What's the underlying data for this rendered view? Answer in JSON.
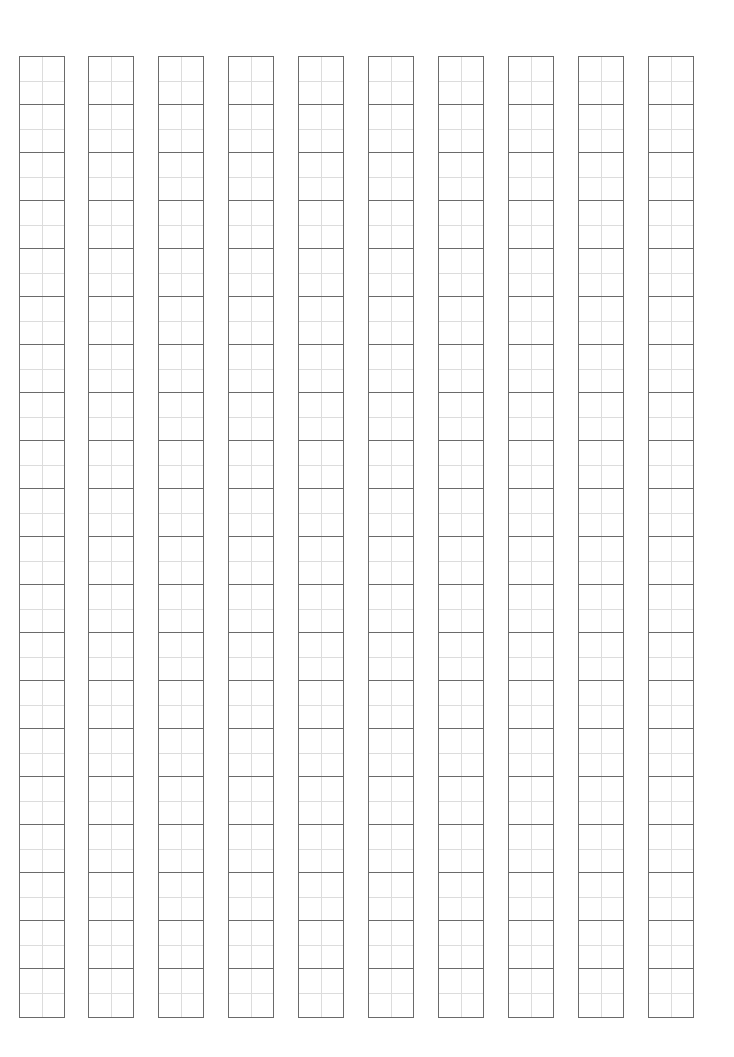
{
  "sheet": {
    "type": "tianzige-practice-grid",
    "columns": 10,
    "rows_per_column": 20,
    "column_left_positions_px": [
      19,
      88,
      158,
      228,
      298,
      368,
      438,
      508,
      578,
      648
    ],
    "column_width_px": 46,
    "grid_top_px": 56,
    "cell_height_px": 48,
    "colors": {
      "background": "#ffffff",
      "cell_border": "#6a6a6a",
      "guide_line": "#dcdcdc"
    }
  }
}
